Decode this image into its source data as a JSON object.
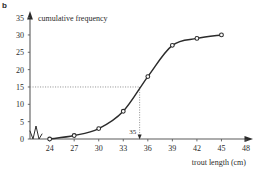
{
  "part_label": "b",
  "chart_data": {
    "type": "line",
    "title": "",
    "xlabel": "trout length (cm)",
    "ylabel": "cumulative frequency",
    "x": [
      24,
      27,
      30,
      33,
      36,
      39,
      42,
      45
    ],
    "values": [
      0,
      1,
      3,
      8,
      18,
      27,
      29,
      30
    ],
    "series": [
      {
        "name": "cumulative frequency",
        "values": [
          0,
          1,
          3,
          8,
          18,
          27,
          29,
          30
        ]
      }
    ],
    "xlim": [
      24,
      48
    ],
    "ylim": [
      0,
      35
    ],
    "xticks": [
      24,
      27,
      30,
      33,
      36,
      39,
      42,
      45,
      48
    ],
    "yticks": [
      0,
      5,
      10,
      15,
      20,
      25,
      30,
      35
    ],
    "grid": false,
    "legend": "none",
    "axis_break": "y-axis-zigzag-near-origin",
    "annotations": [
      {
        "name": "median-construction",
        "label": "35",
        "from_y": 15,
        "to_x": 35,
        "style": "dotted"
      }
    ]
  },
  "axis": {
    "y_labels": [
      "35",
      "30",
      "25",
      "20",
      "15",
      "10",
      "5",
      "0"
    ],
    "x_labels": [
      "24",
      "27",
      "30",
      "33",
      "36",
      "39",
      "42",
      "45",
      "48"
    ],
    "y_title": "cumulative frequency",
    "x_title": "trout length (cm)",
    "median_annotation": "35"
  },
  "colors": {
    "ink": "#2b2b2b",
    "axis": "#5a5a5a",
    "curve": "#2b2b2b",
    "dotted": "#8c8c8c"
  }
}
